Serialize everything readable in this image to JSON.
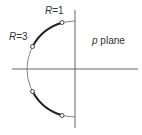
{
  "diagram": {
    "plane_label_var": "p",
    "plane_label_word": "plane",
    "labels": {
      "r1_var": "R",
      "r1_eq": "=1",
      "r3_var": "R",
      "r3_eq": "=3"
    },
    "colors": {
      "axis": "#666666",
      "thin_arc": "#777777",
      "thick_arc": "#222222",
      "marker_fill": "#ffffff",
      "marker_stroke": "#333333"
    },
    "geometry": {
      "center": [
        75,
        69
      ],
      "radius": 48,
      "h_axis": [
        12,
        138
      ],
      "v_axis": [
        10,
        128
      ]
    },
    "markers": [
      {
        "name": "R=1 upper",
        "x": 62,
        "y": 21
      },
      {
        "name": "R=3 upper",
        "x": 32,
        "y": 47
      },
      {
        "name": "R=3 lower",
        "x": 32,
        "y": 91
      },
      {
        "name": "R=1 lower",
        "x": 62,
        "y": 117
      }
    ]
  }
}
